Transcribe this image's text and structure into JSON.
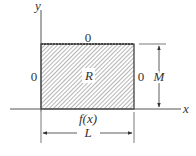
{
  "diagram": {
    "axes": {
      "x_label": "x",
      "y_label": "y"
    },
    "region": {
      "label": "R"
    },
    "boundary_conditions": {
      "top": "0",
      "left": "0",
      "right": "0",
      "bottom": "f(x)"
    },
    "dimensions": {
      "width": "L",
      "height": "M"
    },
    "colors": {
      "line": "#333333",
      "hatch": "#777777",
      "background": "#ffffff"
    }
  }
}
